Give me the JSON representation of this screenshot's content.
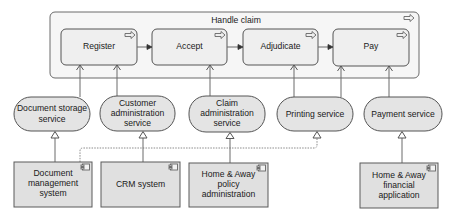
{
  "diagram": {
    "container": {
      "title": "Handle claim",
      "icon": "process-arrow-icon"
    },
    "processes": [
      {
        "id": "register",
        "label": "Register",
        "icon": "process-arrow-icon"
      },
      {
        "id": "accept",
        "label": "Accept",
        "icon": "process-arrow-icon"
      },
      {
        "id": "adjudicate",
        "label": "Adjudicate",
        "icon": "process-arrow-icon"
      },
      {
        "id": "pay",
        "label": "Pay",
        "icon": "process-arrow-icon"
      }
    ],
    "services": [
      {
        "id": "document-storage",
        "lines": [
          "Document storage",
          "service"
        ]
      },
      {
        "id": "customer-administration",
        "lines": [
          "Customer",
          "administration",
          "service"
        ]
      },
      {
        "id": "claim-administration",
        "lines": [
          "Claim",
          "administration",
          "service"
        ]
      },
      {
        "id": "printing",
        "lines": [
          "Printing service"
        ]
      },
      {
        "id": "payment",
        "lines": [
          "Payment service"
        ]
      }
    ],
    "applications": [
      {
        "id": "document-management-system",
        "lines": [
          "Document",
          "management",
          "system"
        ],
        "icon": "component-icon"
      },
      {
        "id": "crm-system",
        "lines": [
          "CRM system"
        ],
        "icon": "component-icon"
      },
      {
        "id": "home-away-policy-administration",
        "lines": [
          "Home & Away",
          "policy",
          "administration"
        ],
        "icon": "component-icon"
      },
      {
        "id": "home-away-financial-application",
        "lines": [
          "Home & Away",
          "financial",
          "application"
        ],
        "icon": "component-icon"
      }
    ],
    "relationships": {
      "triggering": [
        {
          "from": "register",
          "to": "accept"
        },
        {
          "from": "accept",
          "to": "adjudicate"
        },
        {
          "from": "adjudicate",
          "to": "pay"
        }
      ],
      "used_by": [
        {
          "from": "document-storage",
          "to": "register"
        },
        {
          "from": "customer-administration",
          "to": "register"
        },
        {
          "from": "claim-administration",
          "to": "accept"
        },
        {
          "from": "printing",
          "to": "adjudicate"
        },
        {
          "from": "printing",
          "to": "pay"
        },
        {
          "from": "payment",
          "to": "pay"
        }
      ],
      "realization": [
        {
          "from": "document-management-system",
          "to": "document-storage",
          "style": "solid"
        },
        {
          "from": "document-management-system",
          "to": "printing",
          "style": "dotted"
        },
        {
          "from": "crm-system",
          "to": "customer-administration",
          "style": "solid"
        },
        {
          "from": "home-away-policy-administration",
          "to": "claim-administration",
          "style": "solid"
        },
        {
          "from": "home-away-financial-application",
          "to": "payment",
          "style": "solid"
        }
      ]
    }
  }
}
